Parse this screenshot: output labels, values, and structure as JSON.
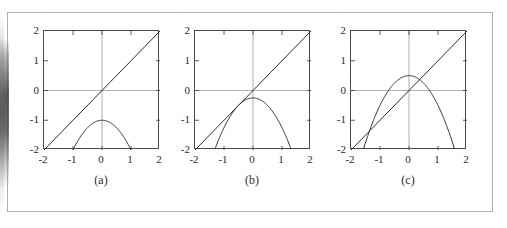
{
  "figure": {
    "background_color": "#ffffff",
    "border_color": "#b0b0b0",
    "axis_color": "#4a4a4a",
    "gridline_color": "#9a9a9a",
    "curve_color": "#2b2b2b"
  },
  "chart_data": [
    {
      "type": "line",
      "panel_id": "a",
      "caption": "(a)",
      "title": "",
      "xlabel": "",
      "ylabel": "",
      "xlim": [
        -2,
        2
      ],
      "ylim": [
        -2,
        2
      ],
      "xticks": [
        -2,
        -1,
        0,
        1,
        2
      ],
      "yticks": [
        -2,
        -1,
        0,
        1,
        2
      ],
      "xtick_labels": [
        "-2",
        "-1",
        "0",
        "1",
        "2"
      ],
      "ytick_labels": [
        "-2",
        "-1",
        "0",
        "1",
        "2"
      ],
      "grid": false,
      "zero_axes": true,
      "legend": "none",
      "series": [
        {
          "name": "identity-line",
          "expression": "y = x",
          "kind": "line",
          "points": [
            [
              -2,
              -2
            ],
            [
              2,
              2
            ]
          ]
        },
        {
          "name": "parabola",
          "expression": "y = -x^2 - 1",
          "kind": "parabola",
          "vertex": [
            0,
            -1
          ],
          "a": -1,
          "c": -1,
          "roots_at_ylow": [
            -1,
            1
          ],
          "intersections_with_line": []
        }
      ],
      "annotation": "no fixed point: parabola lies entirely below y = x"
    },
    {
      "type": "line",
      "panel_id": "b",
      "caption": "(b)",
      "title": "",
      "xlabel": "",
      "ylabel": "",
      "xlim": [
        -2,
        2
      ],
      "ylim": [
        -2,
        2
      ],
      "xticks": [
        -2,
        -1,
        0,
        1,
        2
      ],
      "yticks": [
        -2,
        -1,
        0,
        1,
        2
      ],
      "xtick_labels": [
        "-2",
        "-1",
        "0",
        "1",
        "2"
      ],
      "ytick_labels": [
        "-2",
        "-1",
        "0",
        "1",
        "2"
      ],
      "grid": false,
      "zero_axes": true,
      "legend": "none",
      "series": [
        {
          "name": "identity-line",
          "expression": "y = x",
          "kind": "line",
          "points": [
            [
              -2,
              -2
            ],
            [
              2,
              2
            ]
          ]
        },
        {
          "name": "parabola",
          "expression": "y = -x^2 - 0.25",
          "kind": "parabola",
          "vertex": [
            0,
            -0.25
          ],
          "a": -1,
          "c": -0.25,
          "roots_at_ylow": [
            -1.32,
            1.32
          ],
          "intersections_with_line": [
            [
              -0.5,
              -0.5
            ]
          ]
        }
      ],
      "annotation": "tangency: single fixed point at x = -0.5"
    },
    {
      "type": "line",
      "panel_id": "c",
      "caption": "(c)",
      "title": "",
      "xlabel": "",
      "ylabel": "",
      "xlim": [
        -2,
        2
      ],
      "ylim": [
        -2,
        2
      ],
      "xticks": [
        -2,
        -1,
        0,
        1,
        2
      ],
      "yticks": [
        -2,
        -1,
        0,
        1,
        2
      ],
      "xtick_labels": [
        "-2",
        "-1",
        "0",
        "1",
        "2"
      ],
      "ytick_labels": [
        "-2",
        "-1",
        "0",
        "1",
        "2"
      ],
      "grid": false,
      "zero_axes": true,
      "legend": "none",
      "series": [
        {
          "name": "identity-line",
          "expression": "y = x",
          "kind": "line",
          "points": [
            [
              -2,
              -2
            ],
            [
              2,
              2
            ]
          ]
        },
        {
          "name": "parabola",
          "expression": "y = -x^2 + 0.5",
          "kind": "parabola",
          "vertex": [
            0,
            0.5
          ],
          "a": -1,
          "c": 0.5,
          "roots_at_ylow": [
            -1.58,
            1.58
          ],
          "intersections_with_line": [
            [
              -1.366,
              -1.366
            ],
            [
              0.366,
              0.366
            ]
          ]
        }
      ],
      "annotation": "two fixed points"
    }
  ]
}
